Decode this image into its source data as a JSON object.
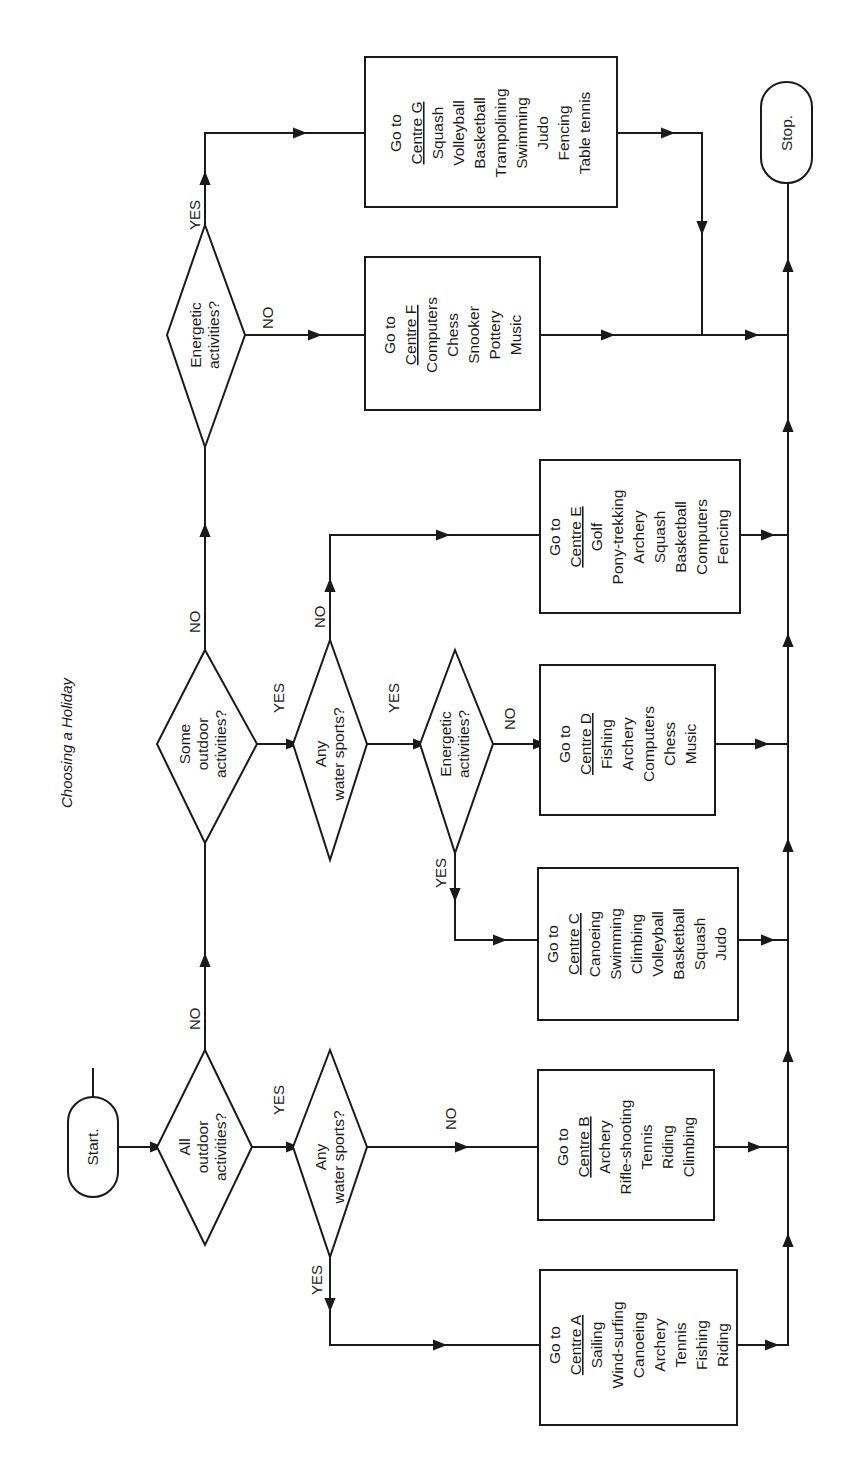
{
  "title": "Choosing a Holiday",
  "terminals": {
    "start": "Start.",
    "stop": "Stop."
  },
  "decisions": {
    "all_outdoor": [
      "All",
      "outdoor",
      "activities?"
    ],
    "some_outdoor": [
      "Some",
      "outdoor",
      "activities?"
    ],
    "water_sports_1": [
      "Any",
      "water sports?"
    ],
    "water_sports_2": [
      "Any",
      "water sports?"
    ],
    "energetic_1": [
      "Energetic",
      "activities?"
    ],
    "energetic_2": [
      "Energetic",
      "activities?"
    ]
  },
  "branch_labels": {
    "yes": "YES",
    "no": "NO"
  },
  "centres": {
    "A": {
      "goto": "Go to",
      "name": "Centre A",
      "activities": [
        "Sailing",
        "Wind-surfing",
        "Canoeing",
        "Archery",
        "Tennis",
        "Fishing",
        "Riding"
      ]
    },
    "B": {
      "goto": "Go to",
      "name": "Centre B",
      "activities": [
        "Archery",
        "Rifle-shooting",
        "Tennis",
        "Riding",
        "Climbing"
      ]
    },
    "C": {
      "goto": "Go to",
      "name": "Centre C",
      "activities": [
        "Canoeing",
        "Swimming",
        "Climbing",
        "Volleyball",
        "Basketball",
        "Squash",
        "Judo"
      ]
    },
    "D": {
      "goto": "Go to",
      "name": "Centre D",
      "activities": [
        "Fishing",
        "Archery",
        "Computers",
        "Chess",
        "Music"
      ]
    },
    "E": {
      "goto": "Go to",
      "name": "Centre E",
      "activities": [
        "Golf",
        "Pony-trekking",
        "Archery",
        "Squash",
        "Basketball",
        "Computers",
        "Fencing"
      ]
    },
    "F": {
      "goto": "Go to",
      "name": "Centre F",
      "activities": [
        "Computers",
        "Chess",
        "Snooker",
        "Pottery",
        "Music"
      ]
    },
    "G": {
      "goto": "Go to",
      "name": "Centre G",
      "activities": [
        "Squash",
        "Volleyball",
        "Basketball",
        "Trampolining",
        "Swimming",
        "Judo",
        "Fencing",
        "Table tennis"
      ]
    }
  },
  "colors": {
    "ink": "#1a1a1a",
    "paper": "#ffffff"
  }
}
